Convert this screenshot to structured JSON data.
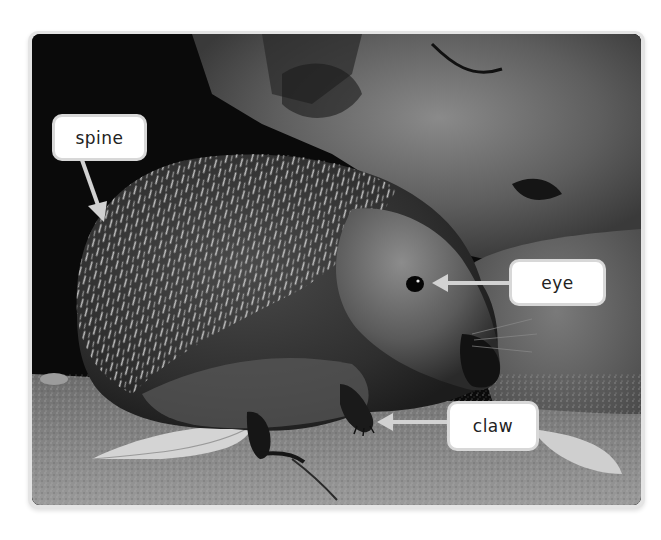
{
  "figure": {
    "labels": [
      {
        "id": "spine",
        "text": "spine"
      },
      {
        "id": "eye",
        "text": "eye"
      },
      {
        "id": "claw",
        "text": "claw"
      }
    ]
  },
  "colors": {
    "label_bg": "#ffffff",
    "label_border": "#d8d8d8",
    "arrow": "#d0d0d0",
    "frame": "#e4e4e4"
  }
}
